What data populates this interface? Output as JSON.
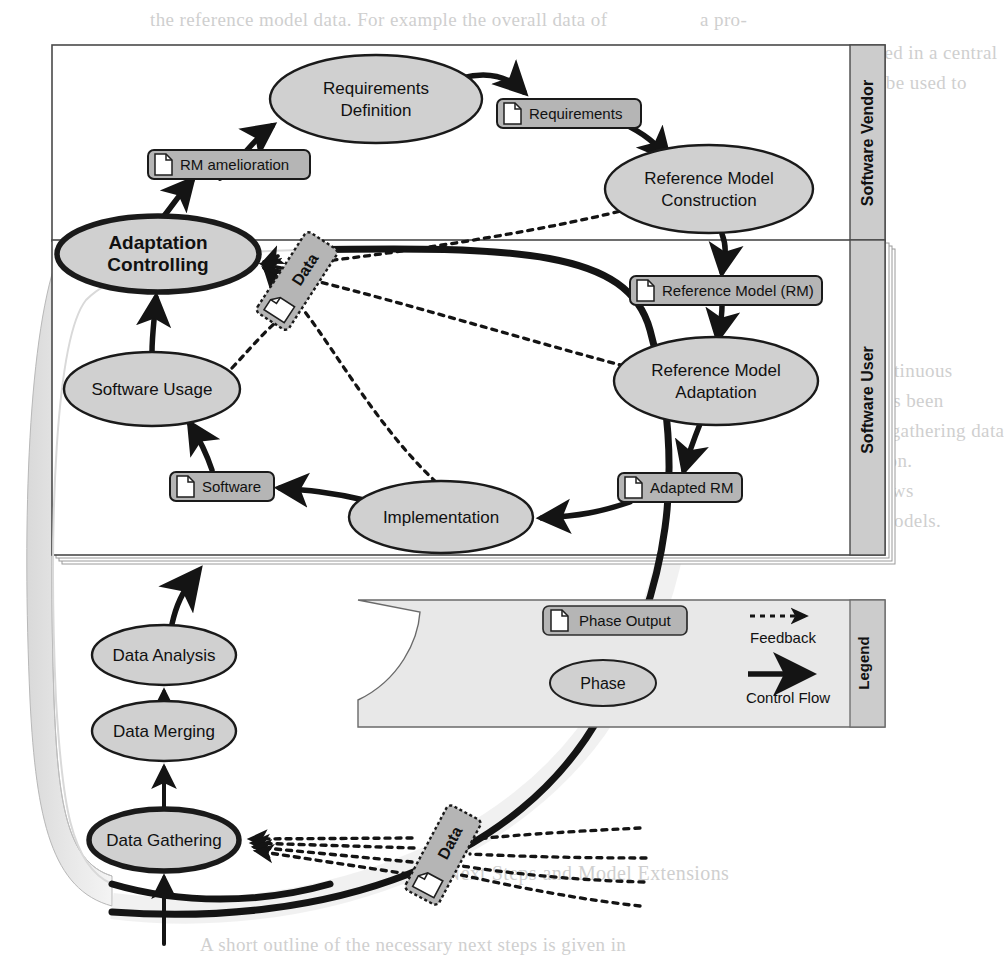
{
  "diagram": {
    "lanes": [
      {
        "id": "vendor",
        "label": "Software Vendor"
      },
      {
        "id": "user",
        "label": "Software User"
      }
    ],
    "legend": {
      "label": "Legend",
      "items": [
        {
          "kind": "phase-output",
          "label": "Phase Output"
        },
        {
          "kind": "phase",
          "label": "Phase"
        },
        {
          "kind": "feedback",
          "label": "Feedback"
        },
        {
          "kind": "control-flow",
          "label": "Control Flow"
        }
      ]
    },
    "phases": [
      {
        "id": "requirements-definition",
        "label": "Requirements Definition",
        "lane": "vendor",
        "emphasis": "normal",
        "cx": 376,
        "cy": 99,
        "rx": 106,
        "ry": 44
      },
      {
        "id": "reference-model-construction",
        "label": "Reference Model Construction",
        "lane": "vendor",
        "emphasis": "normal",
        "cx": 709,
        "cy": 189,
        "rx": 104,
        "ry": 44
      },
      {
        "id": "adaptation-controlling",
        "label": "Adaptation Controlling",
        "lane": "user",
        "emphasis": "bold",
        "cx": 158,
        "cy": 254,
        "rx": 101,
        "ry": 38
      },
      {
        "id": "reference-model-adaptation",
        "label": "Reference Model Adaptation",
        "lane": "user",
        "emphasis": "normal",
        "cx": 716,
        "cy": 381,
        "rx": 102,
        "ry": 44
      },
      {
        "id": "software-usage",
        "label": "Software Usage",
        "lane": "user",
        "emphasis": "normal",
        "cx": 152,
        "cy": 389,
        "rx": 88,
        "ry": 37
      },
      {
        "id": "implementation",
        "label": "Implementation",
        "lane": "user",
        "emphasis": "normal",
        "cx": 441,
        "cy": 517,
        "rx": 92,
        "ry": 36
      },
      {
        "id": "data-analysis",
        "label": "Data Analysis",
        "lane": "data",
        "emphasis": "normal",
        "cx": 164,
        "cy": 655,
        "rx": 72,
        "ry": 30
      },
      {
        "id": "data-merging",
        "label": "Data Merging",
        "lane": "data",
        "emphasis": "normal",
        "cx": 164,
        "cy": 731,
        "rx": 72,
        "ry": 30
      },
      {
        "id": "data-gathering",
        "label": "Data Gathering",
        "lane": "data",
        "emphasis": "bold",
        "cx": 164,
        "cy": 840,
        "rx": 75,
        "ry": 31
      }
    ],
    "phase_outputs": [
      {
        "id": "requirements",
        "label": "Requirements",
        "x": 497,
        "y": 99,
        "w": 144,
        "h": 29
      },
      {
        "id": "rm-amelioration",
        "label": "RM amelioration",
        "x": 148,
        "y": 150,
        "w": 162,
        "h": 29
      },
      {
        "id": "reference-model",
        "label": "Reference Model (RM)",
        "x": 630,
        "y": 276,
        "w": 192,
        "h": 29
      },
      {
        "id": "software",
        "label": "Software",
        "x": 170,
        "y": 472,
        "w": 104,
        "h": 29
      },
      {
        "id": "adapted-rm",
        "label": "Adapted RM",
        "x": 618,
        "y": 473,
        "w": 124,
        "h": 29
      }
    ],
    "data_artifacts": [
      {
        "id": "data-top",
        "label": "Data",
        "cx": 297,
        "cy": 281,
        "rotation": -57
      },
      {
        "id": "data-bottom",
        "label": "Data",
        "cx": 443,
        "cy": 855,
        "rotation": -62
      }
    ],
    "control_flows": [
      {
        "from": "rm-amelioration",
        "to": "requirements-definition"
      },
      {
        "from": "requirements-definition",
        "to": "requirements"
      },
      {
        "from": "requirements",
        "to": "reference-model-construction"
      },
      {
        "from": "reference-model-construction",
        "to": "reference-model"
      },
      {
        "from": "reference-model",
        "to": "reference-model-adaptation"
      },
      {
        "from": "reference-model-adaptation",
        "to": "adapted-rm"
      },
      {
        "from": "adapted-rm",
        "to": "implementation"
      },
      {
        "from": "implementation",
        "to": "software"
      },
      {
        "from": "software",
        "to": "software-usage"
      },
      {
        "from": "software-usage",
        "to": "adaptation-controlling"
      },
      {
        "from": "adaptation-controlling",
        "to": "rm-amelioration"
      },
      {
        "from": "data-gathering",
        "to": "data-merging"
      },
      {
        "from": "data-merging",
        "to": "data-analysis"
      },
      {
        "from": "data-analysis",
        "to": "adaptation-controlling"
      },
      {
        "from": "external",
        "to": "data-gathering"
      }
    ],
    "feedback_flows": [
      {
        "from": "reference-model-construction",
        "to": "adaptation-controlling",
        "via": "data-top"
      },
      {
        "from": "reference-model-adaptation",
        "to": "adaptation-controlling",
        "via": "data-top"
      },
      {
        "from": "implementation",
        "to": "adaptation-controlling",
        "via": "data-top"
      },
      {
        "from": "software-usage",
        "to": "adaptation-controlling",
        "via": "data-top"
      },
      {
        "from": "external-1",
        "to": "data-gathering",
        "via": "data-bottom"
      },
      {
        "from": "external-2",
        "to": "data-gathering",
        "via": "data-bottom"
      },
      {
        "from": "external-3",
        "to": "data-gathering",
        "via": "data-bottom"
      },
      {
        "from": "external-4",
        "to": "data-gathering",
        "via": "data-bottom"
      }
    ],
    "colors": {
      "node_fill": "#d0d0d0",
      "box_fill": "#b5b5b5",
      "lane_label_fill": "#cccccc",
      "legend_fill": "#e4e4e4",
      "stroke": "#1a1a1a",
      "page": "#ffffff"
    }
  },
  "background_text": {
    "lines": [
      {
        "text": "the reference model data. For example the overall data of",
        "x": 150,
        "y": 9,
        "size": 19
      },
      {
        "text": "a pro-",
        "x": 700,
        "y": 9,
        "size": 19
      },
      {
        "text": "can be gathered, merged and analysed in a central",
        "x": 600,
        "y": 42,
        "size": 19
      },
      {
        "text": "repository, the analysis results may be used to",
        "x": 600,
        "y": 72,
        "size": 19
      },
      {
        "text": "enhance the reference model itself.",
        "x": 600,
        "y": 102,
        "size": 19
      },
      {
        "text": "4   Conclusion",
        "x": 600,
        "y": 330,
        "size": 21
      },
      {
        "text": "In this paper an approach for the continuous",
        "x": 600,
        "y": 360,
        "size": 19
      },
      {
        "text": "improvement of reference models has been",
        "x": 600,
        "y": 390,
        "size": 19
      },
      {
        "text": "proposed. The approach is based on gathering data",
        "x": 600,
        "y": 420,
        "size": 19
      },
      {
        "text": "from model usage and implementation.",
        "x": 600,
        "y": 450,
        "size": 19
      },
      {
        "text": "The use of reference model data allows",
        "x": 600,
        "y": 480,
        "size": 19
      },
      {
        "text": "a more precise adaptation of those models.",
        "x": 600,
        "y": 510,
        "size": 19
      },
      {
        "text": "a data repository is continuously composed",
        "x": 430,
        "y": 602,
        "size": 19
      },
      {
        "text": "it is possible to assess reusability in",
        "x": 430,
        "y": 632,
        "size": 19
      },
      {
        "text": "of the candidate reference models. These",
        "x": 430,
        "y": 662,
        "size": 19
      },
      {
        "text": "decisions are being assessed in",
        "x": 430,
        "y": 692,
        "size": 19
      },
      {
        "text": "5   Next Steps and Model Extensions",
        "x": 430,
        "y": 862,
        "size": 20
      },
      {
        "text": "A short outline of the necessary next steps is given in",
        "x": 200,
        "y": 934,
        "size": 19
      }
    ]
  }
}
